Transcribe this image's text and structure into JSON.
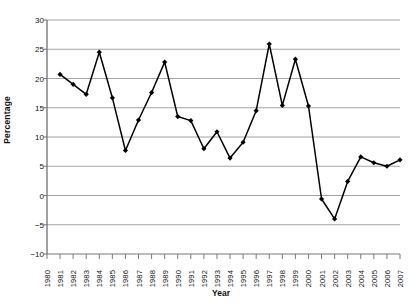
{
  "chart_data": {
    "type": "line",
    "title": "",
    "xlabel": "Year",
    "ylabel": "Percentage",
    "ylim": [
      -10,
      30
    ],
    "yticks": [
      30,
      25,
      20,
      15,
      10,
      5,
      0,
      -5,
      -10
    ],
    "ytick_labels": [
      "30",
      "25",
      "20",
      "15",
      "10",
      "5",
      "0",
      "−5",
      "−10"
    ],
    "grid": "horizontal",
    "legend": "none",
    "marker": "diamond",
    "line_color": "#000000",
    "grid_color": "#9a9a9a",
    "axis_color": "#7a7a7a",
    "categories": [
      "1980",
      "1981",
      "1982",
      "1983",
      "1984",
      "1985",
      "1986",
      "1987",
      "1988",
      "1989",
      "1990",
      "1991",
      "1992",
      "1993",
      "1994",
      "1995",
      "1996",
      "1997",
      "1998",
      "1999",
      "2000",
      "2001",
      "2002",
      "2003",
      "2004",
      "2005",
      "2006",
      "2007"
    ],
    "x": [
      1980,
      1981,
      1982,
      1983,
      1984,
      1985,
      1986,
      1987,
      1988,
      1989,
      1990,
      1991,
      1992,
      1993,
      1994,
      1995,
      1996,
      1997,
      1998,
      1999,
      2000,
      2001,
      2002,
      2003,
      2004,
      2005,
      2006,
      2007
    ],
    "values": [
      null,
      20.7,
      19.0,
      17.3,
      24.5,
      16.7,
      7.7,
      12.9,
      17.6,
      22.8,
      13.5,
      12.8,
      8.0,
      10.9,
      6.4,
      9.1,
      14.5,
      25.9,
      15.4,
      23.3,
      15.3,
      -0.6,
      -4.0,
      2.4,
      6.6,
      5.6,
      5.0,
      6.1
    ],
    "series": [
      {
        "name": "Percentage",
        "values": [
          null,
          20.7,
          19.0,
          17.3,
          24.5,
          16.7,
          7.7,
          12.9,
          17.6,
          22.8,
          13.5,
          12.8,
          8.0,
          10.9,
          6.4,
          9.1,
          14.5,
          25.9,
          15.4,
          23.3,
          15.3,
          -0.6,
          -4.0,
          2.4,
          6.6,
          5.6,
          5.0,
          6.1
        ]
      }
    ]
  }
}
